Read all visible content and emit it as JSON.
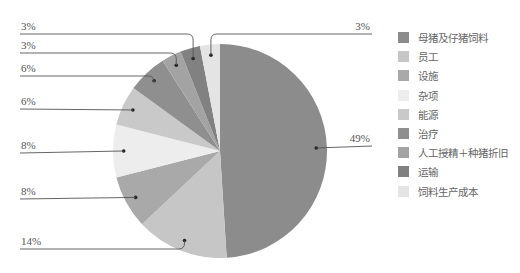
{
  "chart_data": {
    "type": "pie",
    "title": "",
    "start_angle": "12 o'clock, clockwise",
    "categories": [
      "母猪及仔猪饲料",
      "员工",
      "设施",
      "杂项",
      "能源",
      "治疗",
      "人工授精＋种猪折旧",
      "运输",
      "饲料生产成本"
    ],
    "values": [
      49,
      14,
      8,
      8,
      6,
      6,
      3,
      3,
      3
    ],
    "labels": [
      "49%",
      "14%",
      "8%",
      "8%",
      "6%",
      "6%",
      "3%",
      "3%",
      "3%"
    ],
    "colors": [
      "#8c8c8c",
      "#c6c6c6",
      "#a9a9a9",
      "#ededed",
      "#c9c9c9",
      "#8f8f8f",
      "#a3a3a3",
      "#818181",
      "#e4e4e4"
    ],
    "legend_position": "right"
  },
  "legend": {
    "items": [
      {
        "label": "母猪及仔猪饲料",
        "color": "#8c8c8c"
      },
      {
        "label": "员工",
        "color": "#c6c6c6"
      },
      {
        "label": "设施",
        "color": "#a9a9a9"
      },
      {
        "label": "杂项",
        "color": "#ededed"
      },
      {
        "label": "能源",
        "color": "#c9c9c9"
      },
      {
        "label": "治疗",
        "color": "#8f8f8f"
      },
      {
        "label": "人工授精＋种猪折旧",
        "color": "#a3a3a3"
      },
      {
        "label": "运输",
        "color": "#818181"
      },
      {
        "label": "饲料生产成本",
        "color": "#e4e4e4"
      }
    ]
  }
}
